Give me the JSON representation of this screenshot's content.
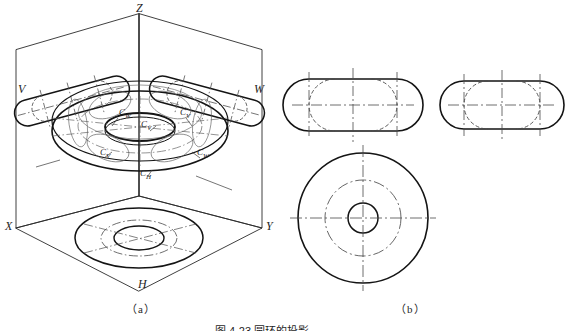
{
  "figure": {
    "caption": "图 4-23  圆环的投影",
    "caption_visible_portion": "图 4-23  圆环的投影",
    "panels": [
      {
        "id": "a",
        "label": "（a）",
        "description": "isometric three-projection-plane box with torus"
      },
      {
        "id": "b",
        "label": "（b）",
        "description": "three orthographic views of the torus"
      }
    ]
  },
  "panel_a": {
    "axis_labels": [
      {
        "name": "z-axis-label",
        "text": "Z",
        "x": 136,
        "y": 3
      },
      {
        "name": "x-axis-label",
        "text": "X",
        "x": 6,
        "y": 222
      },
      {
        "name": "y-axis-label",
        "text": "Y",
        "x": 267,
        "y": 222
      }
    ],
    "plane_labels": [
      {
        "name": "v-plane-label",
        "text": "V",
        "x": 18,
        "y": 84
      },
      {
        "name": "w-plane-label",
        "text": "W",
        "x": 255,
        "y": 84
      },
      {
        "name": "h-plane-label",
        "text": "H",
        "x": 139,
        "y": 281
      }
    ],
    "point_labels": [
      {
        "name": "point-c-w-upper-left",
        "base": "C",
        "sub": "W",
        "x": 120,
        "y": 112
      },
      {
        "name": "point-c-v-upper-right",
        "base": "C",
        "sub": "V",
        "x": 181,
        "y": 112
      },
      {
        "name": "point-c-v-center",
        "base": "C",
        "sub": "V",
        "x": 142,
        "y": 124
      },
      {
        "name": "point-c-v-lower-left",
        "base": "C",
        "sub": "V",
        "x": 101,
        "y": 152
      },
      {
        "name": "point-c-w-lower-right",
        "base": "C",
        "sub": "W",
        "x": 198,
        "y": 152
      },
      {
        "name": "point-c-h-bottom",
        "base": "C",
        "sub": "H",
        "x": 141,
        "y": 173
      }
    ],
    "colors": {
      "outline": "#1a1a1a",
      "thin": "#3a3a3a",
      "centerline": "#555555"
    }
  },
  "panel_b": {
    "views": [
      {
        "name": "front-view",
        "type": "stadium",
        "cx": 353,
        "cy": 105
      },
      {
        "name": "left-side-view",
        "type": "stadium",
        "cx": 502,
        "cy": 105
      },
      {
        "name": "top-view",
        "type": "concentric-circles",
        "cx": 363,
        "cy": 218
      }
    ],
    "top_view_circles": [
      {
        "name": "outer-circle",
        "r": 65,
        "style": "solid"
      },
      {
        "name": "center-circle",
        "r": 38,
        "style": "dash-dot"
      },
      {
        "name": "inner-circle",
        "r": 15,
        "style": "solid"
      }
    ]
  },
  "style_tokens": {
    "stroke_heavy": "#141414",
    "stroke_light": "#3d3d3d",
    "stroke_centerline": "#4a4a4a",
    "background": "#ffffff"
  }
}
